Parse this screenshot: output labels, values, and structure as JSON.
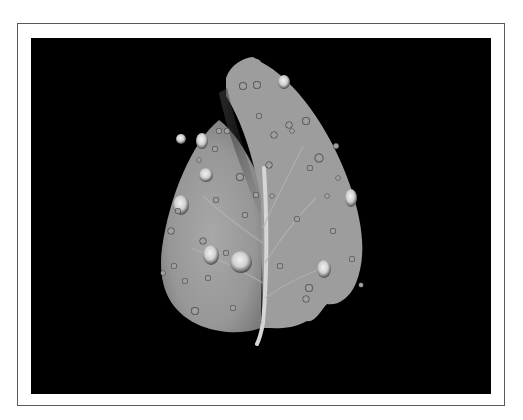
{
  "image": {
    "subject": "leaf with water droplets",
    "style": "black and white photograph",
    "background_color": "#000000",
    "leaf_color": "#9a9a9a",
    "frame_color": "#ffffff",
    "frame_border_color": "#5a5a5a"
  }
}
